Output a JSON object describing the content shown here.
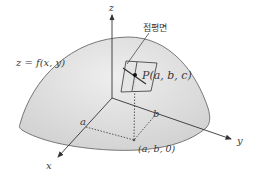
{
  "diagram": {
    "labels": {
      "surface": "z = f(x, y)",
      "tangent_plane": "접평면",
      "point_p": "P(a, b, c)",
      "base_point": "(a, b, 0)",
      "x_axis": "x",
      "y_axis": "y",
      "z_axis": "z",
      "a_tick": "a",
      "b_tick": "b"
    },
    "colors": {
      "surface_fill": "#dcdcdc",
      "surface_edge": "#6a6a6a",
      "line": "#333333",
      "plane_fill": "#e2e2e2",
      "background": "#ffffff"
    }
  }
}
